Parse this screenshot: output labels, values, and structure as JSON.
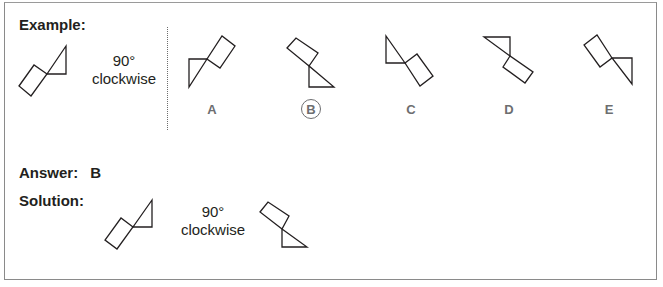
{
  "example": {
    "heading": "Example:",
    "rotation": {
      "angle": "90°",
      "direction": "clockwise"
    },
    "options": [
      {
        "letter": "A",
        "selected": false
      },
      {
        "letter": "B",
        "selected": true
      },
      {
        "letter": "C",
        "selected": false
      },
      {
        "letter": "D",
        "selected": false
      },
      {
        "letter": "E",
        "selected": false
      }
    ]
  },
  "answer": {
    "label": "Answer:",
    "value": "B"
  },
  "solution": {
    "label": "Solution:",
    "rotation": {
      "angle": "90°",
      "direction": "clockwise"
    }
  },
  "colors": {
    "stroke": "#231f20",
    "option_label": "#6d6e70",
    "border": "#8a8a8a"
  }
}
